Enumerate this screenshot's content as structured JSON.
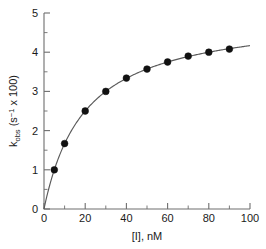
{
  "chart_data": {
    "type": "scatter",
    "title": "",
    "xlabel": "[I], nM",
    "ylabel": "k_obs (s⁻¹ x 100)",
    "ylabel_parts": {
      "base": "k",
      "subscript": "obs",
      "unit_open": " (s",
      "unit_exponent": "−1",
      "unit_close": " x 100)"
    },
    "xlim": [
      0,
      100
    ],
    "ylim": [
      0,
      5
    ],
    "xticks": [
      0,
      20,
      40,
      60,
      80,
      100
    ],
    "xticklabels": [
      "0",
      "20",
      "40",
      "60",
      "80",
      "100"
    ],
    "xminorticks": [
      10,
      30,
      50,
      70,
      90
    ],
    "yticks": [
      0,
      1,
      2,
      3,
      4,
      5
    ],
    "yticklabels": [
      "0",
      "1",
      "2",
      "3",
      "4",
      "5"
    ],
    "yminorticks": [
      0.5,
      1.5,
      2.5,
      3.5,
      4.5
    ],
    "grid": false,
    "legend": false,
    "legend_position": "none",
    "marker": "filled-circle",
    "marker_color": "#111111",
    "curve_color": "#5a5a5a",
    "axis_color": "#6e6e6e",
    "background": "#ffffff",
    "x": [
      5,
      10,
      20,
      30,
      40,
      50,
      60,
      70,
      80,
      90
    ],
    "values": [
      1.0,
      1.67,
      2.5,
      3.0,
      3.34,
      3.57,
      3.75,
      3.9,
      4.0,
      4.08
    ],
    "series": [
      {
        "name": "k_obs",
        "x": [
          5,
          10,
          20,
          30,
          40,
          50,
          60,
          70,
          80,
          90
        ],
        "values": [
          1.0,
          1.67,
          2.5,
          3.0,
          3.34,
          3.57,
          3.75,
          3.9,
          4.0,
          4.08
        ]
      }
    ],
    "fit": {
      "model": "rectangular-hyperbola",
      "equation": "y = 5x/(x + 20)",
      "amplitude": 5.0,
      "half_saturation": 20.0,
      "x_range": [
        0,
        100
      ],
      "y_at_xmax": 4.17
    }
  }
}
